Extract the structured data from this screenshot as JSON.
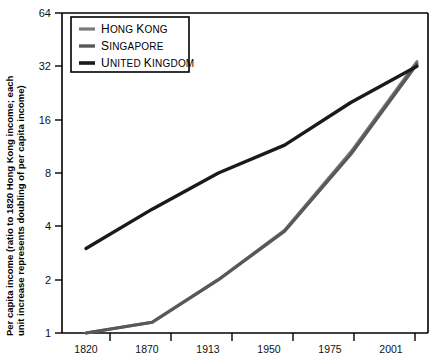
{
  "chart_data": {
    "type": "line",
    "title": "",
    "xlabel": "",
    "ylabel": "Per capita income (ratio to 1820 Hong Kong income; each unit increase represents doubling of per capita income)",
    "categories": [
      "1820",
      "1870",
      "1913",
      "1950",
      "1975",
      "2001"
    ],
    "yticks": [
      "1",
      "2",
      "4",
      "8",
      "16",
      "32",
      "64"
    ],
    "ytick_values": [
      1,
      2,
      4,
      8,
      16,
      32,
      64
    ],
    "ylim": [
      1,
      64
    ],
    "yscale": "log2",
    "grid": false,
    "legend_position": "top-left",
    "series": [
      {
        "name": "Hong Kong",
        "color": "#7a7a7a",
        "values": [
          1.0,
          1.15,
          2.0,
          3.8,
          10.5,
          34.0
        ]
      },
      {
        "name": "Singapore",
        "color": "#585858",
        "values": [
          1.0,
          1.15,
          2.0,
          3.75,
          10.2,
          33.0
        ]
      },
      {
        "name": "United Kingdom",
        "color": "#1a1a1a",
        "values": [
          3.0,
          5.0,
          8.0,
          11.5,
          20.0,
          32.0
        ]
      }
    ]
  },
  "legend": {
    "items": [
      {
        "label": "Hong Kong",
        "label_head": "H",
        "label_rest": "ONG ",
        "label_head2": "K",
        "label_rest2": "ONG"
      },
      {
        "label": "Singapore",
        "label_head": "S",
        "label_rest": "INGAPORE"
      },
      {
        "label": "United Kingdom",
        "label_head": "U",
        "label_rest": "NITED ",
        "label_head2": "K",
        "label_rest2": "INGDOM"
      }
    ]
  },
  "axis": {
    "y_label_line1": "Per capita income (ratio to 1820 Hong Kong income; each",
    "y_label_line2": "unit increase represents doubling of per capita income)"
  },
  "colors": {
    "hong_kong": "#7a7a7a",
    "singapore": "#585858",
    "united_kingdom": "#1a1a1a",
    "axis": "#000000",
    "background": "#ffffff"
  }
}
